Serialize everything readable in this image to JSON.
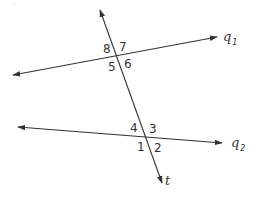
{
  "diagram": {
    "stroke_color": "#333333",
    "background": "#ffffff",
    "lines": {
      "q1": {
        "name": "q",
        "subscript": "1",
        "start": [
          13,
          75
        ],
        "end": [
          217,
          37
        ],
        "arrows": "both"
      },
      "q2": {
        "name": "q",
        "subscript": "2",
        "start": [
          18,
          127
        ],
        "end": [
          222,
          143
        ],
        "arrows": "both"
      },
      "t": {
        "name": "t",
        "start": [
          100,
          10
        ],
        "end": [
          162,
          183
        ],
        "arrows": "both"
      }
    },
    "intersections": {
      "top": {
        "point": [
          117,
          57
        ],
        "lines": [
          "t",
          "q1"
        ]
      },
      "bottom": {
        "point": [
          147,
          137
        ],
        "lines": [
          "t",
          "q2"
        ]
      }
    },
    "angle_labels": {
      "a8": {
        "text": "8",
        "x": 103,
        "y": 53
      },
      "a7": {
        "text": "7",
        "x": 119,
        "y": 51
      },
      "a5": {
        "text": "5",
        "x": 108,
        "y": 71
      },
      "a6": {
        "text": "6",
        "x": 124,
        "y": 68
      },
      "a4": {
        "text": "4",
        "x": 130,
        "y": 132
      },
      "a3": {
        "text": "3",
        "x": 149,
        "y": 133
      },
      "a1": {
        "text": "1",
        "x": 137,
        "y": 151
      },
      "a2": {
        "text": "2",
        "x": 154,
        "y": 152
      }
    }
  }
}
